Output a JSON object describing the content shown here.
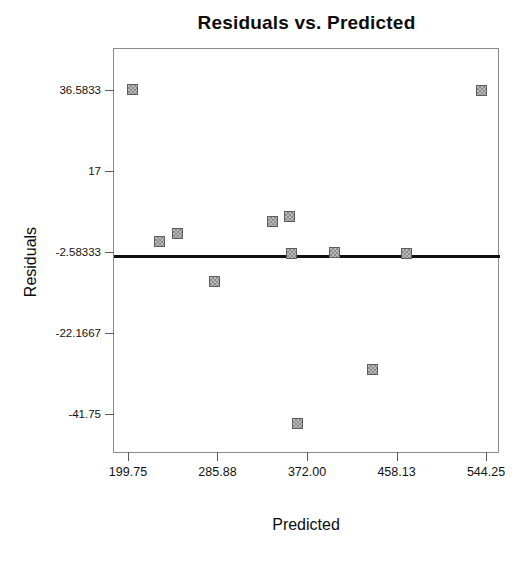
{
  "chart_data": {
    "type": "scatter",
    "title": "Residuals vs. Predicted",
    "xlabel": "Predicted",
    "ylabel": "Residuals",
    "xlim": [
      186.3,
      557.7
    ],
    "ylim": [
      -51.5,
      46.4
    ],
    "grid": false,
    "legend": null,
    "x_ticks": [
      {
        "value": 199.75,
        "label": "199.75"
      },
      {
        "value": 285.88,
        "label": "285.88"
      },
      {
        "value": 372.0,
        "label": "372.00"
      },
      {
        "value": 458.13,
        "label": "458.13"
      },
      {
        "value": 544.25,
        "label": "544.25"
      }
    ],
    "y_ticks": [
      {
        "value": 36.5833,
        "label": "36.5833"
      },
      {
        "value": 17.0,
        "label": "17"
      },
      {
        "value": -2.58333,
        "label": "-2.58333"
      },
      {
        "value": -22.1667,
        "label": "-22.1667"
      },
      {
        "value": -41.75,
        "label": "-41.75"
      }
    ],
    "reference_line": {
      "orientation": "horizontal",
      "value": -3.8,
      "color": "#111111"
    },
    "marker": {
      "shape": "square",
      "fill_color": "#b9b9b9",
      "pattern": "checkered",
      "edge_color": "#5d5d5d",
      "size_px": 11
    },
    "points": [
      {
        "x": 204.0,
        "y": 36.6
      },
      {
        "x": 230.0,
        "y": -0.2
      },
      {
        "x": 247.0,
        "y": 1.9
      },
      {
        "x": 283.0,
        "y": -9.8
      },
      {
        "x": 339.0,
        "y": 4.8
      },
      {
        "x": 355.0,
        "y": 6.0
      },
      {
        "x": 357.0,
        "y": -3.0
      },
      {
        "x": 363.0,
        "y": -44.2
      },
      {
        "x": 398.0,
        "y": -2.7
      },
      {
        "x": 435.0,
        "y": -31.0
      },
      {
        "x": 468.0,
        "y": -3.0
      },
      {
        "x": 540.0,
        "y": 36.4
      }
    ],
    "n_points": 12
  }
}
